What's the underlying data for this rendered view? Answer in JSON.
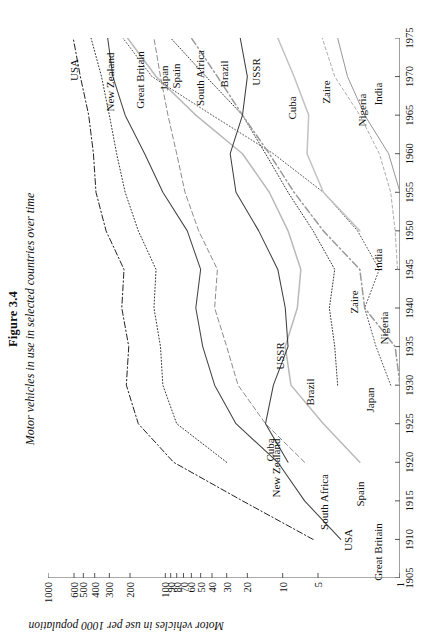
{
  "figure": {
    "number": "Figure 3.4",
    "caption": "Motor vehicles in use in selected countries over time"
  },
  "axes": {
    "y_title": "Motor vehicles in use per 1000 population",
    "y_ticks": [
      "1000",
      "600",
      "500",
      "400",
      "300",
      "200",
      "100",
      "90",
      "80",
      "70",
      "60",
      "50",
      "40",
      "30",
      "20",
      "10",
      "5",
      "1"
    ],
    "x_ticks": [
      "1905",
      "1910",
      "1915",
      "1920",
      "1925",
      "1930",
      "1935",
      "1940",
      "1945",
      "1950",
      "1955",
      "1960",
      "1965",
      "1970",
      "1975"
    ]
  },
  "chart_data": {
    "type": "line",
    "title": "Motor vehicles in use in selected countries over time",
    "subtitle": "Figure 3.4",
    "xlabel": "",
    "ylabel": "Motor vehicles in use per 1000 population",
    "yscale": "log",
    "ylim": [
      1,
      1000
    ],
    "xlim": [
      1905,
      1975
    ],
    "grid": false,
    "legend": "inline-end-labels",
    "y_tick_values": [
      1000,
      600,
      500,
      400,
      300,
      200,
      100,
      90,
      80,
      70,
      60,
      50,
      40,
      30,
      20,
      10,
      5,
      1
    ],
    "x_tick_values": [
      1905,
      1910,
      1915,
      1920,
      1925,
      1930,
      1935,
      1940,
      1945,
      1950,
      1955,
      1960,
      1965,
      1970,
      1975
    ],
    "series": [
      {
        "name": "USA",
        "style": "dash-dot",
        "color": "#222222",
        "label_start": "USA",
        "label_end": "USA",
        "x": [
          1910,
          1915,
          1920,
          1925,
          1930,
          1935,
          1940,
          1945,
          1950,
          1955,
          1960,
          1965,
          1970,
          1975
        ],
        "y": [
          5.5,
          22,
          85,
          170,
          215,
          205,
          235,
          225,
          320,
          390,
          410,
          450,
          530,
          610
        ]
      },
      {
        "name": "New Zealand",
        "style": "dotted",
        "color": "#333333",
        "label_start": "New Zealand",
        "label_end": "New Zealand",
        "x": [
          1920,
          1925,
          1930,
          1935,
          1940,
          1945,
          1950,
          1955,
          1960,
          1965,
          1970,
          1975
        ],
        "y": [
          30,
          80,
          105,
          110,
          125,
          120,
          170,
          220,
          260,
          300,
          350,
          430
        ]
      },
      {
        "name": "Great Britain",
        "style": "solid",
        "color": "#444444",
        "label_start": "Great Britain",
        "label_end": "Great Britain",
        "x": [
          1910,
          1915,
          1920,
          1925,
          1930,
          1935,
          1940,
          1945,
          1950,
          1955,
          1960,
          1965,
          1970,
          1975
        ],
        "y": [
          3.2,
          6.5,
          11,
          25,
          38,
          48,
          55,
          50,
          65,
          105,
          150,
          220,
          280,
          310
        ]
      },
      {
        "name": "Japan",
        "style": "dotted",
        "color": "#555555",
        "label_start": "Japan",
        "label_end": "Japan",
        "x": [
          1930,
          1935,
          1940,
          1945,
          1950,
          1955,
          1960,
          1965,
          1970,
          1975
        ],
        "y": [
          1.2,
          1.6,
          2.0,
          1.5,
          2.3,
          4.5,
          12,
          40,
          130,
          230
        ]
      },
      {
        "name": "Spain",
        "style": "solid-light",
        "color": "#b9b9b9",
        "label_start": "Spain",
        "label_end": "Spain",
        "x": [
          1920,
          1925,
          1930,
          1935,
          1940,
          1945,
          1950,
          1955,
          1960,
          1965,
          1970,
          1975
        ],
        "y": [
          2.2,
          4.5,
          8.5,
          9.5,
          7.5,
          7.0,
          9.0,
          13,
          22,
          55,
          120,
          210
        ]
      },
      {
        "name": "South Africa",
        "style": "dashed",
        "color": "#8c8c8c",
        "label_start": "South Africa",
        "label_end": "South Africa",
        "x": [
          1920,
          1925,
          1930,
          1935,
          1940,
          1945,
          1950,
          1955,
          1960,
          1965,
          1970,
          1975
        ],
        "y": [
          6.5,
          14,
          24,
          30,
          38,
          36,
          52,
          68,
          80,
          95,
          110,
          125
        ]
      },
      {
        "name": "Brazil",
        "style": "dotted-dark",
        "color": "#3a3a3a",
        "label_start": "Brazil",
        "label_end": "Brazil",
        "x": [
          1930,
          1935,
          1940,
          1945,
          1950,
          1955,
          1960,
          1965,
          1970,
          1975
        ],
        "y": [
          3.4,
          3.6,
          4.0,
          3.6,
          5.5,
          9.0,
          14,
          22,
          45,
          90
        ]
      },
      {
        "name": "USSR",
        "style": "dash-dot-light",
        "color": "#9a9a9a",
        "label_start": "USSR",
        "label_end": "USSR",
        "x": [
          1930,
          1935,
          1940,
          1945,
          1950,
          1955,
          1960,
          1965,
          1970,
          1975
        ],
        "y": [
          1.0,
          1.1,
          2.0,
          2.2,
          4.5,
          8.0,
          13,
          22,
          36,
          60
        ]
      },
      {
        "name": "Cuba",
        "style": "solid",
        "color": "#3f3f3f",
        "label_start": "Cuba",
        "label_end": "Cuba",
        "x": [
          1920,
          1925,
          1930,
          1935,
          1940,
          1945,
          1950,
          1955,
          1960,
          1965,
          1970,
          1975
        ],
        "y": [
          9.0,
          14,
          12,
          9.0,
          9.5,
          11,
          16,
          25,
          28,
          22,
          20,
          23
        ]
      },
      {
        "name": "Zaire",
        "style": "solid-light2",
        "color": "#c2c2c2",
        "label_start": "Zaire",
        "label_end": "Zaire",
        "x": [
          1950,
          1955,
          1960,
          1965,
          1970,
          1975
        ],
        "y": [
          2.2,
          4.5,
          6.2,
          6.0,
          8.0,
          11
        ]
      },
      {
        "name": "Nigeria",
        "style": "dashed-fine",
        "color": "#9d9d9d",
        "label_start": "Nigeria",
        "label_end": "Nigeria",
        "x": [
          1945,
          1950,
          1955,
          1960,
          1965,
          1970,
          1975
        ],
        "y": [
          1.05,
          1.1,
          1.2,
          1.5,
          2.2,
          3.6,
          4.6
        ]
      },
      {
        "name": "India",
        "style": "solid-thin",
        "color": "#8a8a8a",
        "label_start": "India",
        "label_end": "India",
        "x": [
          1955,
          1960,
          1965,
          1970,
          1975
        ],
        "y": [
          1.0,
          1.25,
          2.0,
          2.8,
          3.4
        ]
      }
    ]
  },
  "series_labels_end": [
    "USA",
    "New Zealand",
    "Great Britain",
    "Japan",
    "Spain",
    "South Africa",
    "Brazil",
    "USSR",
    "Cuba",
    "Zaire",
    "Nigeria",
    "India"
  ],
  "series_labels_start": [
    "USA",
    "Great Britain",
    "New Zealand",
    "South Africa",
    "Cuba",
    "Spain",
    "Brazil",
    "Japan",
    "USSR",
    "Zaire",
    "Nigeria",
    "India"
  ]
}
